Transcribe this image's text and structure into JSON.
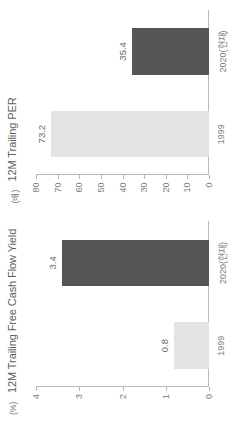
{
  "figure": {
    "orientation": "rotated-90-ccw"
  },
  "chart_data": [
    {
      "type": "bar",
      "title": "12M Trailing Free Cash Flow Yield",
      "unit": "(%)",
      "xlabel": "",
      "ylabel": "%",
      "categories": [
        "1999",
        "2020(현재)"
      ],
      "values": [
        0.8,
        3.4
      ],
      "labels": [
        "0.8",
        "3.4"
      ],
      "colors": [
        "#e4e4e4",
        "#555555"
      ],
      "ylim": [
        0,
        4
      ],
      "yticks": [
        0,
        1,
        2,
        3,
        4
      ],
      "ytick_labels": [
        "0",
        "1",
        "2",
        "3",
        "4"
      ],
      "grid": false,
      "legend": "none"
    },
    {
      "type": "bar",
      "title": "12M Trailing PER",
      "unit": "(배)",
      "xlabel": "",
      "ylabel": "배",
      "categories": [
        "1999",
        "2020(현재)"
      ],
      "values": [
        73.2,
        35.4
      ],
      "labels": [
        "73.2",
        "35.4"
      ],
      "colors": [
        "#e4e4e4",
        "#555555"
      ],
      "ylim": [
        0,
        80
      ],
      "yticks": [
        0,
        10,
        20,
        30,
        40,
        50,
        60,
        70,
        80
      ],
      "ytick_labels": [
        "0",
        "10",
        "20",
        "30",
        "40",
        "50",
        "60",
        "70",
        "80"
      ],
      "grid": false,
      "legend": "none"
    }
  ]
}
